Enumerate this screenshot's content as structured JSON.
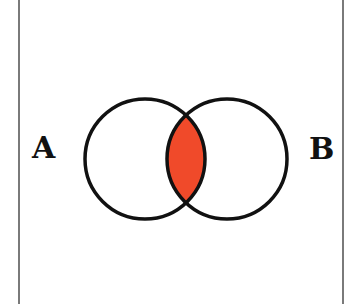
{
  "diagram": {
    "type": "venn",
    "sets": [
      {
        "label": "A",
        "cx": 145,
        "cy": 159,
        "r": 60
      },
      {
        "label": "B",
        "cx": 227,
        "cy": 159,
        "r": 60
      }
    ],
    "highlighted_region": "A ∩ B",
    "highlight_color": "#F04A2A",
    "stroke_color": "#111111",
    "frame_color": "#7a7a7a"
  }
}
